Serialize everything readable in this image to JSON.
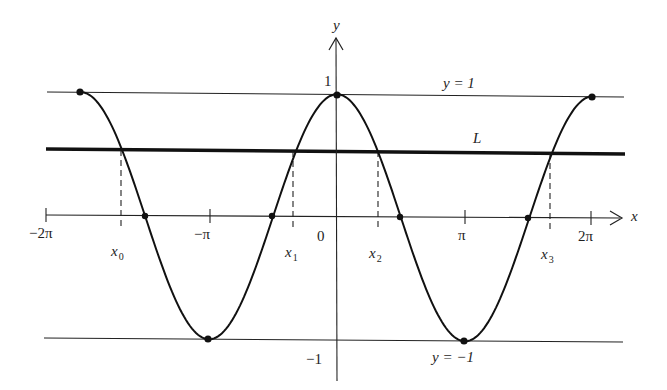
{
  "figure": {
    "axes": {
      "x_label": "x",
      "y_label": "y",
      "origin_label": "0",
      "x_ticks": [
        "−2π",
        "−π",
        "π",
        "2π"
      ],
      "y_ticks": [
        "1",
        "−1"
      ]
    },
    "lines": {
      "upper": "y = 1",
      "lower": "y = −1",
      "horizontal": "L"
    },
    "intersections": [
      "x",
      "x",
      "x",
      "x"
    ],
    "intersection_subscripts": [
      "0",
      "1",
      "2",
      "3"
    ],
    "colors": {
      "ink": "#1e1e1e",
      "background": "#ffffff"
    }
  },
  "chart_data": {
    "type": "line",
    "title": "",
    "xlabel": "x",
    "ylabel": "y",
    "function": "y = cos x",
    "x_tick_labels": [
      "−2π",
      "−π",
      "0",
      "π",
      "2π"
    ],
    "y_tick_labels": [
      "−1",
      "0",
      "1"
    ],
    "ylim": [
      -1,
      1
    ],
    "series": [
      {
        "name": "cos x",
        "x": [
          -2.0,
          -1.5,
          -1.0,
          -0.5,
          0.0,
          0.5,
          1.0,
          1.5,
          2.0
        ],
        "x_units": "π",
        "values": [
          1,
          0,
          -1,
          0,
          1,
          0,
          -1,
          0,
          1
        ]
      }
    ],
    "horizontal_lines": [
      {
        "label": "y = 1",
        "y": 1
      },
      {
        "label": "L",
        "y": 0.5
      },
      {
        "label": "y = −1",
        "y": -1
      }
    ],
    "annotations": [
      {
        "label": "x₀",
        "note": "intersection of cos x with L, dashed drop to x-axis"
      },
      {
        "label": "x₁",
        "note": "intersection of cos x with L"
      },
      {
        "label": "x₂",
        "note": "intersection of cos x with L"
      },
      {
        "label": "x₃",
        "note": "intersection of cos x with L"
      }
    ],
    "marked_points": [
      "maxima at y = 1",
      "minima at y = −1",
      "zeros on x-axis"
    ],
    "grid": false,
    "legend": "none"
  }
}
